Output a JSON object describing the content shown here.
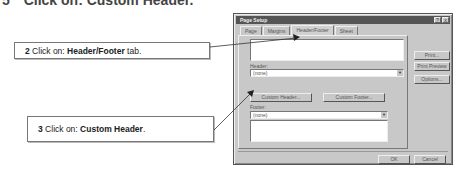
{
  "instructions": {
    "step1": {
      "bullet": "5",
      "text": "Click on:",
      "bold": "Custom Header."
    },
    "step2": {
      "number": "2",
      "text": "Click on:",
      "bold": "Header/Footer",
      "suffix": "tab."
    },
    "step3": {
      "number": "3",
      "text": "Click on:",
      "bold": "Custom Header",
      "suffix": "."
    }
  },
  "dialog": {
    "title": "Page Setup",
    "title_buttons": {
      "help": "?",
      "close": "x"
    },
    "tabs": [
      {
        "label": "Page",
        "active": false
      },
      {
        "label": "Margins",
        "active": false
      },
      {
        "label": "Header/Footer",
        "active": true
      },
      {
        "label": "Sheet",
        "active": false
      }
    ],
    "header_label": "Header:",
    "header_value": "(none)",
    "footer_label": "Footer:",
    "footer_value": "(none)",
    "custom_header_button": "Custom Header...",
    "custom_footer_button": "Custom Footer...",
    "side_buttons": {
      "print": "Print...",
      "print_preview": "Print Preview",
      "options": "Options..."
    },
    "ok_button": "OK",
    "cancel_button": "Cancel",
    "combo_arrow": "▼"
  }
}
